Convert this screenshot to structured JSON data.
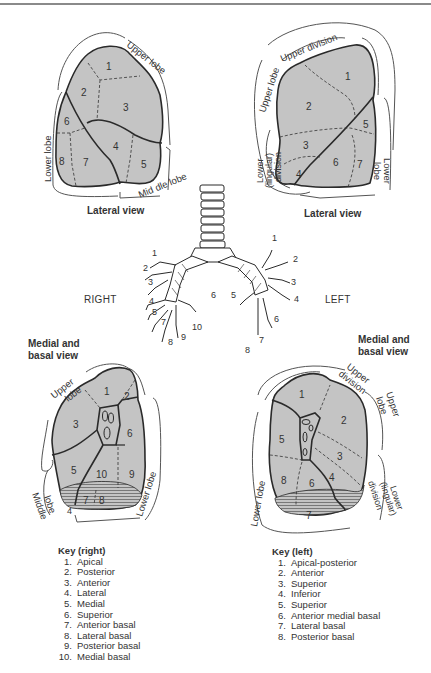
{
  "figure": {
    "orientation": {
      "right": "RIGHT",
      "left": "LEFT"
    },
    "lateral_right": {
      "view_title": "Lateral view",
      "lobe_labels": {
        "upper": "Upper lobe",
        "middle": "Mid dle lobe",
        "lower": "Lower lobe"
      },
      "segments": [
        "1",
        "2",
        "3",
        "4",
        "5",
        "6",
        "7",
        "8"
      ]
    },
    "lateral_left": {
      "view_title": "Lateral view",
      "lobe_labels": {
        "upper_lobe": "Upper lobe",
        "upper_division": "Upper division",
        "lower_lingular_1": "Lower",
        "lower_lingular_2": "(lingular)",
        "lower_lingular_3": "division",
        "lower_lobe_1": "Lower",
        "lower_lobe_2": "lobe"
      },
      "segments": [
        "1",
        "2",
        "3",
        "4",
        "5",
        "6",
        "7"
      ]
    },
    "medial_right": {
      "view_title_1": "Medial and",
      "view_title_2": "basal view",
      "lobe_labels": {
        "upper_1": "Upper",
        "upper_2": "lobe",
        "middle_1": "Middle",
        "middle_2": "lobe",
        "lower": "Lower lobe"
      },
      "segments": [
        "1",
        "2",
        "3",
        "4",
        "5",
        "6",
        "7",
        "8",
        "9",
        "10"
      ]
    },
    "medial_left": {
      "view_title_1": "Medial and",
      "view_title_2": "basal view",
      "lobe_labels": {
        "upper_division_1": "Upper",
        "upper_division_2": "division",
        "upper_lobe_1": "Upper",
        "upper_lobe_2": "lobe",
        "lower_lingular_1": "Lower",
        "lower_lingular_2": "(lingular)",
        "lower_lingular_3": "division",
        "lower_lobe": "Lower lobe"
      },
      "segments": [
        "1",
        "2",
        "3",
        "4",
        "5",
        "6",
        "7",
        "8"
      ]
    },
    "bronchial_tree": {
      "right_labels": [
        "1",
        "2",
        "3",
        "4",
        "5",
        "6",
        "7",
        "8",
        "9",
        "10"
      ],
      "left_labels": [
        "1",
        "2",
        "3",
        "4",
        "5",
        "6",
        "7",
        "8"
      ]
    },
    "key_right": {
      "title": "Key (right)",
      "items": [
        {
          "n": "1.",
          "label": "Apical"
        },
        {
          "n": "2.",
          "label": "Posterior"
        },
        {
          "n": "3.",
          "label": "Anterior"
        },
        {
          "n": "4.",
          "label": "Lateral"
        },
        {
          "n": "5.",
          "label": "Medial"
        },
        {
          "n": "6.",
          "label": "Superior"
        },
        {
          "n": "7.",
          "label": "Anterior basal"
        },
        {
          "n": "8.",
          "label": "Lateral basal"
        },
        {
          "n": "9.",
          "label": "Posterior basal"
        },
        {
          "n": "10.",
          "label": "Medial basal"
        }
      ]
    },
    "key_left": {
      "title": "Key (left)",
      "items": [
        {
          "n": "1.",
          "label": "Apical-posterior"
        },
        {
          "n": "2.",
          "label": "Anterior"
        },
        {
          "n": "3.",
          "label": "Superior"
        },
        {
          "n": "4.",
          "label": "Inferior"
        },
        {
          "n": "5.",
          "label": "Superior"
        },
        {
          "n": "6.",
          "label": "Anterior medial basal"
        },
        {
          "n": "7.",
          "label": "Lateral basal"
        },
        {
          "n": "8.",
          "label": "Posterior basal"
        }
      ]
    },
    "colors": {
      "lung_fill": "#c4c4c4",
      "outline": "#2a2a2a",
      "bracket": "#555555"
    }
  }
}
